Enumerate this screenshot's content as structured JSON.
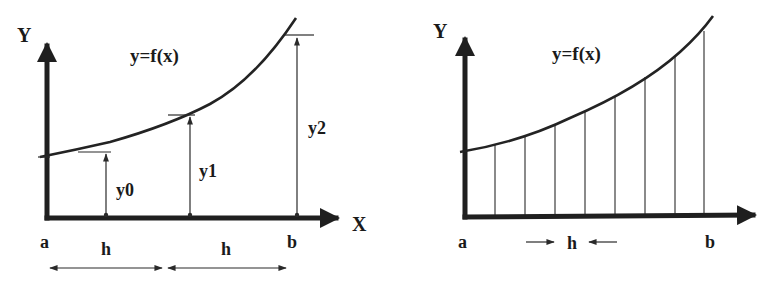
{
  "left_diagram": {
    "title": "Trapezoidal / ordinate construction with two intervals",
    "y_axis_label": "Y",
    "x_axis_label": "X",
    "function_label": "y=f(x)",
    "ordinates": [
      {
        "label": "y0"
      },
      {
        "label": "y1"
      },
      {
        "label": "y2"
      }
    ],
    "x_labels": {
      "start": "a",
      "end": "b"
    },
    "interval_labels": [
      "h",
      "h"
    ]
  },
  "right_diagram": {
    "title": "Subdivision of [a,b] into equal strips of width h",
    "y_axis_label": "Y",
    "function_label": "y=f(x)",
    "x_labels": {
      "start": "a",
      "end": "b"
    },
    "interval_label": "h",
    "strip_count": 8
  },
  "colors": {
    "ink": "#1f1f1f",
    "background": "#ffffff"
  }
}
